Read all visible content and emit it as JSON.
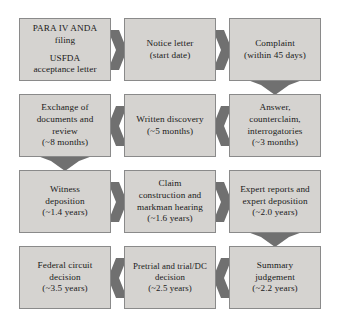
{
  "diagram": {
    "colors": {
      "box_fill": "#d5d3d0",
      "box_border": "#8a8a8a",
      "arrow_fill": "#707070",
      "text": "#1a1a1a",
      "background": "#ffffff"
    },
    "flow_direction": "serpentine: row 1 left-to-right, row 2 right-to-left, row 3 left-to-right, row 4 right-to-left",
    "nodes": [
      {
        "id": "para-iv-anda-filing",
        "row": 1,
        "column": 1,
        "lines": [
          "PARA IV ANDA",
          "filing"
        ],
        "lines2": [
          "USFDA",
          "acceptance letter"
        ]
      },
      {
        "id": "notice-letter",
        "row": 1,
        "column": 2,
        "lines": [
          "Notice letter",
          "(start date)"
        ]
      },
      {
        "id": "complaint",
        "row": 1,
        "column": 3,
        "lines": [
          "Complaint",
          "(within 45 days)"
        ]
      },
      {
        "id": "exchange-of-documents",
        "row": 2,
        "column": 1,
        "lines": [
          "Exchange of",
          "documents and",
          "review",
          "(~8 months)"
        ]
      },
      {
        "id": "written-discovery",
        "row": 2,
        "column": 2,
        "lines": [
          "Written discovery",
          "(~5 months)"
        ]
      },
      {
        "id": "answer-counterclaim",
        "row": 2,
        "column": 3,
        "lines": [
          "Answer,",
          "counterclaim,",
          "interrogatories",
          "(~3 months)"
        ]
      },
      {
        "id": "witness-deposition",
        "row": 3,
        "column": 1,
        "lines": [
          "Witness",
          "deposition",
          "(~1.4 years)"
        ]
      },
      {
        "id": "claim-construction",
        "row": 3,
        "column": 2,
        "lines": [
          "Claim",
          "construction and",
          "markman hearing",
          "(~1.6 years)"
        ]
      },
      {
        "id": "expert-reports",
        "row": 3,
        "column": 3,
        "lines": [
          "Expert reports and",
          "expert deposition",
          "(~2.0 years)"
        ]
      },
      {
        "id": "federal-circuit-decision",
        "row": 4,
        "column": 1,
        "lines": [
          "Federal circuit",
          "decision",
          "(~3.5 years)"
        ]
      },
      {
        "id": "pretrial-and-trial",
        "row": 4,
        "column": 2,
        "lines": [
          "Pretrial and trial/DC",
          "decision",
          "(~2.5 years)"
        ]
      },
      {
        "id": "summary-judgement",
        "row": 4,
        "column": 3,
        "lines": [
          "Summary",
          "judgement",
          "(~2.2 years)"
        ]
      }
    ],
    "connectors": [
      {
        "id": "c1",
        "from": "para-iv-anda-filing",
        "to": "notice-letter",
        "direction": "right"
      },
      {
        "id": "c2",
        "from": "notice-letter",
        "to": "complaint",
        "direction": "right"
      },
      {
        "id": "c3",
        "from": "complaint",
        "to": "answer-counterclaim",
        "direction": "down"
      },
      {
        "id": "c4",
        "from": "answer-counterclaim",
        "to": "written-discovery",
        "direction": "left"
      },
      {
        "id": "c5",
        "from": "written-discovery",
        "to": "exchange-of-documents",
        "direction": "left"
      },
      {
        "id": "c6",
        "from": "exchange-of-documents",
        "to": "witness-deposition",
        "direction": "down"
      },
      {
        "id": "c7",
        "from": "witness-deposition",
        "to": "claim-construction",
        "direction": "right"
      },
      {
        "id": "c8",
        "from": "claim-construction",
        "to": "expert-reports",
        "direction": "right"
      },
      {
        "id": "c9",
        "from": "expert-reports",
        "to": "summary-judgement",
        "direction": "down"
      },
      {
        "id": "c10",
        "from": "summary-judgement",
        "to": "pretrial-and-trial",
        "direction": "left"
      },
      {
        "id": "c11",
        "from": "pretrial-and-trial",
        "to": "federal-circuit-decision",
        "direction": "left"
      }
    ]
  }
}
